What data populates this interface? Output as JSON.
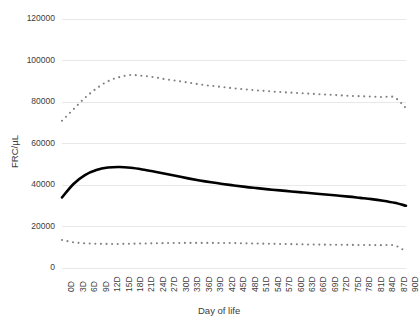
{
  "chart_data": {
    "type": "line",
    "title": "",
    "subtitle": "",
    "xlabel": "Day of life",
    "ylabel": "FRC/µL",
    "x": [
      "0D",
      "3D",
      "6D",
      "9D",
      "12D",
      "15D",
      "18D",
      "21D",
      "24D",
      "27D",
      "30D",
      "33D",
      "36D",
      "39D",
      "42D",
      "45D",
      "48D",
      "51D",
      "54D",
      "57D",
      "60D",
      "63D",
      "66D",
      "69D",
      "72D",
      "75D",
      "78D",
      "81D",
      "84D",
      "87D",
      "90D"
    ],
    "xlim": [
      0,
      90
    ],
    "ylim": [
      0,
      120000
    ],
    "yticks": [
      0,
      20000,
      40000,
      60000,
      80000,
      100000,
      120000
    ],
    "ytick_labels": [
      "0",
      "20000",
      "40000",
      "60000",
      "80000",
      "100000",
      "120000"
    ],
    "grid": "horizontal",
    "legend": "none",
    "series": [
      {
        "name": "upper-bound",
        "style": "dotted",
        "color": "#808080",
        "values": [
          71000,
          76500,
          82000,
          86500,
          90000,
          92000,
          93000,
          92600,
          92000,
          91000,
          90200,
          89400,
          88500,
          87800,
          87200,
          86600,
          86100,
          85600,
          85200,
          84800,
          84500,
          84200,
          83900,
          83600,
          83300,
          83000,
          82800,
          82600,
          82400,
          82200,
          77000
        ]
      },
      {
        "name": "mean",
        "style": "solid-bold",
        "color": "#000000",
        "values": [
          34000,
          40500,
          44800,
          47200,
          48400,
          48700,
          48300,
          47500,
          46500,
          45400,
          44300,
          43200,
          42200,
          41300,
          40500,
          39800,
          39100,
          38500,
          37900,
          37400,
          36900,
          36400,
          35900,
          35400,
          34900,
          34400,
          33800,
          33200,
          32400,
          31400,
          30000
        ]
      },
      {
        "name": "lower-bound",
        "style": "dotted",
        "color": "#808080",
        "values": [
          13500,
          12400,
          11900,
          11700,
          11600,
          11600,
          11700,
          11800,
          11900,
          12000,
          12050,
          12100,
          12100,
          12100,
          12050,
          12000,
          11900,
          11800,
          11700,
          11600,
          11500,
          11400,
          11300,
          11250,
          11200,
          11150,
          11100,
          11050,
          11000,
          10900,
          8000
        ]
      }
    ]
  },
  "styling": {
    "grid_color": "#e8e8e8",
    "text_color": "#3c3c3c",
    "background": "#ffffff",
    "dotted_series_color": "#808080",
    "mean_series_color": "#000000"
  }
}
